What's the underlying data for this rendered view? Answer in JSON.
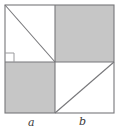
{
  "figure": {
    "type": "geometric-diagram",
    "colors": {
      "shaded_fill": "#c6c6c6",
      "unshaded_fill": "#ffffff",
      "stroke": "#77777a",
      "label_text": "#3a3a3a",
      "page_background": "#ffffff"
    },
    "outer_square": {
      "left": 5,
      "top": 5,
      "right": 114,
      "bottom": 113,
      "width": 109,
      "height": 108
    },
    "division_point": {
      "x": 55,
      "y": 62
    },
    "quadrants": [
      {
        "name": "top-left",
        "fill": "unshaded",
        "diagonal": "top-left-to-bottom-right"
      },
      {
        "name": "top-right",
        "fill": "shaded",
        "diagonal": "none"
      },
      {
        "name": "bottom-left",
        "fill": "shaded",
        "diagonal": "none"
      },
      {
        "name": "bottom-right",
        "fill": "unshaded",
        "diagonal": "bottom-left-to-top-right"
      }
    ],
    "right_angle_marker": {
      "present": true,
      "location": "lower-left of upper-left quadrant",
      "x": 5,
      "y": 53,
      "size": 9
    },
    "labels": {
      "segment_a": "a",
      "segment_b": "b"
    }
  }
}
